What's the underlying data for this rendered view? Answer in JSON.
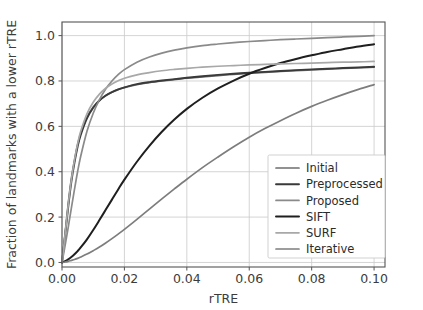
{
  "chart_data": {
    "type": "line",
    "title": "",
    "xlabel": "rTRE",
    "ylabel": "Fraction of landmarks with a lower rTRE",
    "xlim": [
      0.0,
      0.1035
    ],
    "ylim": [
      -0.02,
      1.06
    ],
    "xticks": [
      0.0,
      0.02,
      0.04,
      0.06,
      0.08,
      0.1
    ],
    "xticklabels": [
      "0.00",
      "0.02",
      "0.04",
      "0.06",
      "0.08",
      "0.10"
    ],
    "yticks": [
      0.0,
      0.2,
      0.4,
      0.6,
      0.8,
      1.0
    ],
    "yticklabels": [
      "0.0",
      "0.2",
      "0.4",
      "0.6",
      "0.8",
      "1.0"
    ],
    "grid": true,
    "grid_color": "#c9c9c9",
    "legend_position": "lower right",
    "x": [
      0.0,
      0.001,
      0.002,
      0.003,
      0.004,
      0.005,
      0.006,
      0.008,
      0.01,
      0.012,
      0.014,
      0.016,
      0.018,
      0.02,
      0.024,
      0.028,
      0.032,
      0.036,
      0.04,
      0.045,
      0.05,
      0.055,
      0.06,
      0.065,
      0.07,
      0.075,
      0.08,
      0.085,
      0.09,
      0.095,
      0.1
    ],
    "series": [
      {
        "name": "Initial",
        "color": "#6e6e6e",
        "width": 1.7,
        "values": [
          0.0,
          0.13,
          0.26,
          0.37,
          0.45,
          0.52,
          0.57,
          0.64,
          0.685,
          0.715,
          0.735,
          0.75,
          0.762,
          0.771,
          0.784,
          0.793,
          0.8,
          0.806,
          0.812,
          0.818,
          0.824,
          0.829,
          0.834,
          0.838,
          0.842,
          0.846,
          0.849,
          0.852,
          0.855,
          0.858,
          0.861
        ]
      },
      {
        "name": "Preprocessed",
        "color": "#3a3a3a",
        "width": 1.9,
        "values": [
          0.0,
          0.12,
          0.245,
          0.355,
          0.44,
          0.51,
          0.562,
          0.635,
          0.682,
          0.714,
          0.736,
          0.751,
          0.763,
          0.772,
          0.786,
          0.795,
          0.802,
          0.808,
          0.814,
          0.821,
          0.827,
          0.832,
          0.836,
          0.84,
          0.844,
          0.848,
          0.851,
          0.854,
          0.857,
          0.86,
          0.863
        ]
      },
      {
        "name": "Proposed",
        "color": "#8a8a8a",
        "width": 1.7,
        "values": [
          0.0,
          0.075,
          0.155,
          0.24,
          0.322,
          0.4,
          0.468,
          0.578,
          0.658,
          0.718,
          0.765,
          0.8,
          0.828,
          0.85,
          0.883,
          0.906,
          0.923,
          0.936,
          0.946,
          0.956,
          0.963,
          0.969,
          0.974,
          0.978,
          0.982,
          0.985,
          0.988,
          0.991,
          0.994,
          0.997,
          1.0
        ]
      },
      {
        "name": "SIFT",
        "color": "#1f1f1f",
        "width": 2.0,
        "values": [
          0.0,
          0.006,
          0.014,
          0.024,
          0.036,
          0.05,
          0.066,
          0.102,
          0.143,
          0.187,
          0.232,
          0.277,
          0.322,
          0.365,
          0.444,
          0.514,
          0.576,
          0.63,
          0.677,
          0.726,
          0.767,
          0.802,
          0.832,
          0.857,
          0.879,
          0.897,
          0.913,
          0.928,
          0.94,
          0.952,
          0.962
        ]
      },
      {
        "name": "SURF",
        "color": "#a8a8a8",
        "width": 1.7,
        "values": [
          0.0,
          0.125,
          0.255,
          0.365,
          0.452,
          0.523,
          0.578,
          0.655,
          0.706,
          0.742,
          0.768,
          0.787,
          0.801,
          0.812,
          0.827,
          0.837,
          0.845,
          0.851,
          0.856,
          0.861,
          0.865,
          0.868,
          0.871,
          0.873,
          0.875,
          0.877,
          0.879,
          0.881,
          0.883,
          0.884,
          0.886
        ]
      },
      {
        "name": "Iterative",
        "color": "#7d7d7d",
        "width": 1.7,
        "values": [
          0.0,
          0.002,
          0.005,
          0.009,
          0.013,
          0.018,
          0.024,
          0.037,
          0.052,
          0.068,
          0.086,
          0.105,
          0.125,
          0.146,
          0.19,
          0.235,
          0.28,
          0.324,
          0.367,
          0.418,
          0.465,
          0.51,
          0.552,
          0.59,
          0.625,
          0.658,
          0.688,
          0.715,
          0.74,
          0.763,
          0.784
        ]
      }
    ]
  },
  "legend": {
    "entries": [
      {
        "label": "Initial"
      },
      {
        "label": "Preprocessed"
      },
      {
        "label": "Proposed"
      },
      {
        "label": "SIFT"
      },
      {
        "label": "SURF"
      },
      {
        "label": "Iterative"
      }
    ]
  }
}
